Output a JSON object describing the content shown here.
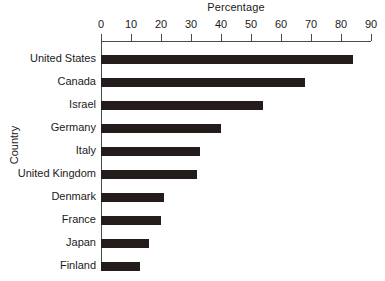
{
  "chart_data": {
    "type": "bar",
    "orientation": "horizontal",
    "title": "Percentage",
    "xlabel": "Percentage",
    "ylabel": "Country",
    "categories": [
      "United States",
      "Canada",
      "Israel",
      "Germany",
      "Italy",
      "United Kingdom",
      "Denmark",
      "France",
      "Japan",
      "Finland"
    ],
    "values": [
      84,
      68,
      54,
      40,
      33,
      32,
      21,
      20,
      16,
      13
    ],
    "xlim": [
      0,
      90
    ],
    "xticks": [
      0,
      10,
      20,
      30,
      40,
      50,
      60,
      70,
      80,
      90
    ],
    "xtick_labels": [
      "0",
      "10",
      "20",
      "30",
      "40",
      "50",
      "60",
      "70",
      "80",
      "90"
    ],
    "grid": false,
    "legend": false,
    "bar_color": "#241c1a",
    "axis_color": "#4a4a4a",
    "background": "#ffffff",
    "axis_position": "top"
  }
}
